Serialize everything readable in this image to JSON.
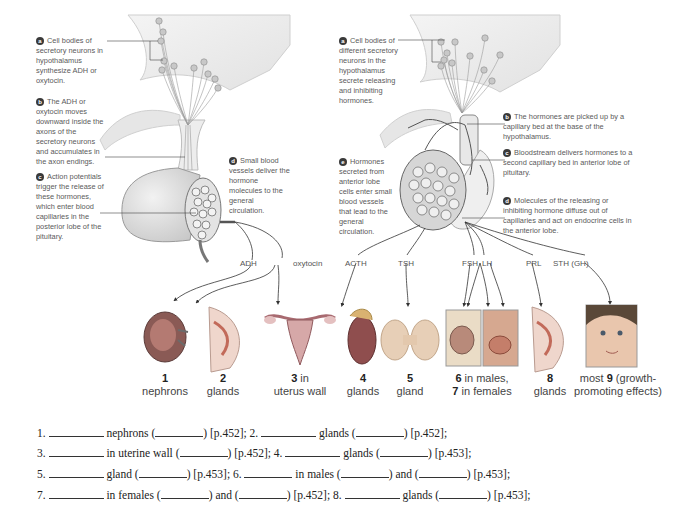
{
  "left_panel": {
    "notes": [
      {
        "badge": "a",
        "text": "Cell bodies of secretory neurons in hypothalamus synthesize ADH or oxytocin."
      },
      {
        "badge": "b",
        "text": "The ADH or oxytocin moves downward inside the axons of the secretory neurons and accumulates in the axon endings."
      },
      {
        "badge": "c",
        "text": "Action potentials trigger the release of these hormones, which enter blood capillaries in the posterior lobe of the pituitary."
      },
      {
        "badge": "d",
        "text": "Small blood vessels deliver the hormone molecules to the general circulation."
      }
    ],
    "hormones": [
      "ADH",
      "oxytocin"
    ]
  },
  "right_panel": {
    "notes": [
      {
        "badge": "a",
        "text": "Cell bodies of different secretory neurons in the hypothalamus secrete releasing and inhibiting hormones."
      },
      {
        "badge": "b",
        "text": "The hormones are picked up by a capillary bed at the base of the hypothalamus."
      },
      {
        "badge": "c",
        "text": "Bloodstream delivers hormones to a second capillary bed in anterior lobe of pituitary."
      },
      {
        "badge": "d",
        "text": "Molecules of the releasing or inhibiting hormone diffuse out of capillaries and act on endocrine cells in the anterior lobe."
      },
      {
        "badge": "e",
        "text": "Hormones secreted from anterior lobe cells enter small blood vessels that lead to the general circulation."
      }
    ],
    "hormones": [
      "ACTH",
      "TSH",
      "FSH",
      "LH",
      "PRL",
      "STH (GH)"
    ]
  },
  "targets": [
    {
      "num": "1",
      "line1_after": "",
      "line2": "nephrons",
      "image": "kidney"
    },
    {
      "num": "2",
      "line1_after": "",
      "line2": "glands",
      "image": "mammary-gland"
    },
    {
      "num": "3",
      "line1_after": " in",
      "line2": "uterus wall",
      "image": "uterus"
    },
    {
      "num": "4",
      "line1_after": "",
      "line2": "glands",
      "image": "adrenal-kidney"
    },
    {
      "num": "5",
      "line1_after": "",
      "line2": "gland",
      "image": "thyroid"
    },
    {
      "num": "6",
      "line1_after": " in males,",
      "num2": "7",
      "line2_after": " in females",
      "image": "gonads"
    },
    {
      "num": "8",
      "line1_after": "",
      "line2": "glands",
      "image": "mammary-gland-2"
    },
    {
      "num": "9",
      "line1_before": "most ",
      "line1_after": " (growth-",
      "line2": "promoting effects)",
      "image": "baby-face"
    }
  ],
  "questions": [
    {
      "parts": [
        "1.",
        "nephrons (",
        ") [p.452]; 2.",
        "glands (",
        ") [p.452];"
      ]
    },
    {
      "parts": [
        "3.",
        "in uterine wall (",
        ") [p.452]; 4.",
        "glands (",
        ") [p.453];"
      ]
    },
    {
      "parts": [
        "5.",
        "gland (",
        ") [p.453]; 6.",
        "in males (",
        ") and (",
        ") [p.453];"
      ]
    },
    {
      "parts": [
        "7.",
        "in females (",
        ") and (",
        ") [p.452]; 8.",
        "glands (",
        ") [p.453];"
      ]
    }
  ]
}
